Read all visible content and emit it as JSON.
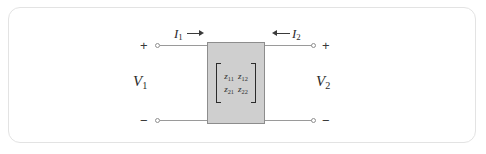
{
  "figure": {
    "type": "two-port-network-diagram",
    "frame": {
      "border_color": "#e3e3e3",
      "background_color": "#ffffff",
      "corner_radius_px": 12
    },
    "block": {
      "name": "two-port block",
      "fill_color": "#cfcfcf",
      "stroke_color": "#8d8d8d"
    },
    "wire_color": "#9a9a9a",
    "text_color": "#2b2b2b"
  },
  "matrix": {
    "name": "z-parameter matrix",
    "open_bracket": "[",
    "close_bracket": "]",
    "rows": [
      [
        {
          "symbol": "z",
          "subscript": "11"
        },
        {
          "symbol": "z",
          "subscript": "12"
        }
      ],
      [
        {
          "symbol": "z",
          "subscript": "21"
        },
        {
          "symbol": "z",
          "subscript": "22"
        }
      ]
    ]
  },
  "ports": {
    "input": {
      "voltage": {
        "symbol": "V",
        "subscript": "1"
      },
      "current": {
        "symbol": "I",
        "subscript": "1",
        "arrow": "right"
      },
      "top_terminal_sign": "+",
      "bottom_terminal_sign": "−"
    },
    "output": {
      "voltage": {
        "symbol": "V",
        "subscript": "2"
      },
      "current": {
        "symbol": "I",
        "subscript": "2",
        "arrow": "left"
      },
      "top_terminal_sign": "+",
      "bottom_terminal_sign": "−"
    }
  }
}
